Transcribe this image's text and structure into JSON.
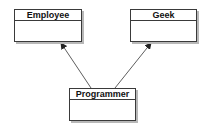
{
  "diagram": {
    "type": "uml-class-diagram",
    "classes": [
      {
        "name": "Employee"
      },
      {
        "name": "Geek"
      },
      {
        "name": "Programmer"
      }
    ],
    "relationships": [
      {
        "from": "Programmer",
        "to": "Employee",
        "type": "inheritance-arrow"
      },
      {
        "from": "Programmer",
        "to": "Geek",
        "type": "inheritance-arrow"
      }
    ]
  }
}
